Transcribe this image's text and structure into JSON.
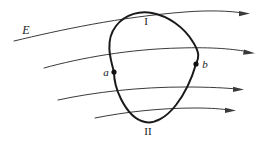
{
  "figure": {
    "type": "physics-diagram",
    "background_color": "#ffffff",
    "labels": [
      {
        "id": "field-label",
        "text": "E",
        "style": "italic",
        "x": 26,
        "y": 30,
        "font_size": 12
      },
      {
        "id": "arc-one",
        "text": "I",
        "style": "roman",
        "x": 146,
        "y": 21,
        "font_size": 11
      },
      {
        "id": "arc-two",
        "text": "II",
        "style": "roman",
        "x": 148,
        "y": 131,
        "font_size": 11
      },
      {
        "id": "point-a",
        "text": "a",
        "style": "italic",
        "x": 106,
        "y": 72,
        "font_size": 11
      },
      {
        "id": "point-b",
        "text": "b",
        "style": "italic",
        "x": 205,
        "y": 64,
        "font_size": 11
      }
    ],
    "points": [
      {
        "id": "a",
        "x": 114,
        "y": 72,
        "radius": 2.6,
        "color": "#111111"
      },
      {
        "id": "b",
        "x": 196,
        "y": 64,
        "radius": 2.6,
        "color": "#111111"
      }
    ],
    "contour": {
      "id": "closed-contour",
      "color": "#1a1a1a",
      "stroke_width": 2,
      "fill": "none",
      "path": "M 114 72 C 110 58 105 40 116 26 C 126 13 141 11 152 13 C 168 16 184 27 193 42 C 200 53 199 58 196 64 C 192 78 186 92 176 105 C 166 118 154 124 145 122 C 135 120 127 111 121 99 C 115 87 114 79 114 72 Z"
    },
    "field_lines": [
      {
        "id": "field-line-1",
        "color": "#3a3a3a",
        "stroke_width": 1,
        "path": "M 14 41 C 60 30 120 17 185 12 C 210 10 230 11 243 13",
        "arrow_at": {
          "x": 246,
          "y": 13.4,
          "angle": 9
        }
      },
      {
        "id": "field-line-2",
        "color": "#3a3a3a",
        "stroke_width": 1,
        "path": "M 44 68 C 80 58 130 49 180 48 C 212 47 235 49 249 52",
        "arrow_at": {
          "x": 251,
          "y": 52.4,
          "angle": 13
        }
      },
      {
        "id": "field-line-3",
        "color": "#3a3a3a",
        "stroke_width": 1,
        "path": "M 58 100 C 95 92 140 87 185 87 C 210 87 226 88 237 89",
        "arrow_at": {
          "x": 240,
          "y": 89.2,
          "angle": 7
        }
      },
      {
        "id": "field-line-4",
        "color": "#3a3a3a",
        "stroke_width": 1,
        "path": "M 95 118 C 125 112 160 108 195 108 C 212 108 222 109 229 110",
        "arrow_at": {
          "x": 232,
          "y": 110.2,
          "angle": 7
        }
      }
    ]
  }
}
